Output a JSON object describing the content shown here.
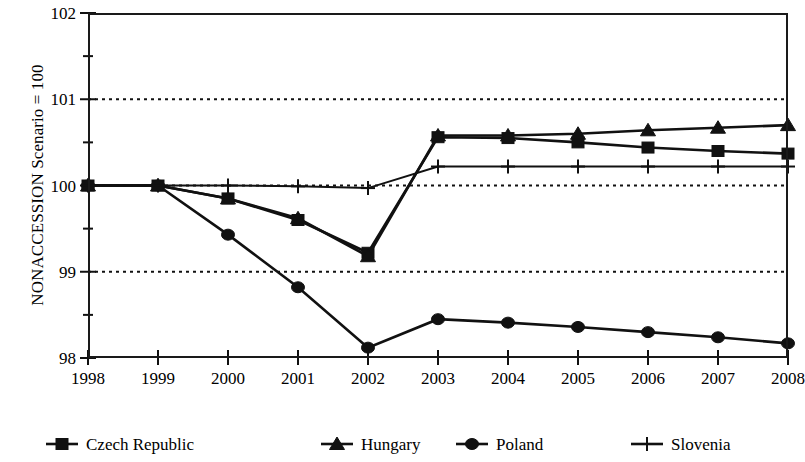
{
  "chart_data": {
    "type": "line",
    "title": "",
    "xlabel": "",
    "ylabel": "NONACCESSION Scenario = 100",
    "x": [
      1998,
      1999,
      2000,
      2001,
      2002,
      2003,
      2004,
      2005,
      2006,
      2007,
      2008
    ],
    "xtick_labels": [
      "1998",
      "1999",
      "2000",
      "2001",
      "2002",
      "2003",
      "2004",
      "2005",
      "2006",
      "2007",
      "2008"
    ],
    "ytick_labels": [
      "98",
      "99",
      "100",
      "101",
      "102"
    ],
    "ytick_values": [
      98,
      99,
      100,
      101,
      102
    ],
    "yminor_values": [
      98.5,
      99.5,
      100.5,
      101.5
    ],
    "ylim": [
      98,
      102
    ],
    "xlim": [
      1998,
      2008
    ],
    "gridlines": {
      "horizontal_at": [
        99,
        100,
        101
      ],
      "style": "dotted",
      "vertical": false
    },
    "legend_position": "bottom",
    "series": [
      {
        "name": "Czech Republic",
        "marker": "square",
        "values": [
          100,
          100,
          99.85,
          99.6,
          99.22,
          100.56,
          100.55,
          100.5,
          100.44,
          100.4,
          100.37
        ]
      },
      {
        "name": "Hungary",
        "marker": "triangle",
        "values": [
          100,
          100,
          99.85,
          99.62,
          99.18,
          100.58,
          100.58,
          100.6,
          100.64,
          100.67,
          100.7
        ]
      },
      {
        "name": "Poland",
        "marker": "circle",
        "values": [
          100,
          100,
          99.43,
          98.82,
          98.12,
          98.45,
          98.41,
          98.36,
          98.3,
          98.24,
          98.17
        ]
      },
      {
        "name": "Slovenia",
        "marker": "plus",
        "values": [
          100,
          100,
          100.0,
          99.99,
          99.97,
          100.22,
          100.22,
          100.22,
          100.22,
          100.22,
          100.22
        ]
      }
    ]
  },
  "colors": {
    "ink": "#111111",
    "grid": "#111111",
    "background": "#ffffff"
  },
  "legend": {
    "entries": [
      {
        "label": "Czech Republic",
        "marker": "square"
      },
      {
        "label": "Hungary",
        "marker": "triangle"
      },
      {
        "label": "Poland",
        "marker": "circle"
      },
      {
        "label": "Slovenia",
        "marker": "plus"
      }
    ]
  }
}
